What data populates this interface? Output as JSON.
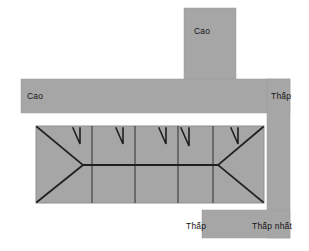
{
  "figure": {
    "type": "fishbone-band-diagram",
    "background_color": "#ffffff",
    "band_color": "#a6a6a6",
    "band_stroke_color": "#8f8f8f",
    "line_color": "#262626"
  },
  "labels": {
    "cao_top": "Cao",
    "cao_left": "Cao",
    "thap_right": "Thấp",
    "thap_bottom": "Thấp",
    "thap_nhat": "Thấp nhất"
  },
  "bands": [
    {
      "name": "top-vertical-band",
      "x": 184,
      "y": 8,
      "w": 52,
      "h": 72
    },
    {
      "name": "middle-horizontal-band",
      "x": 21,
      "y": 79,
      "w": 269,
      "h": 34
    },
    {
      "name": "right-vertical-band",
      "x": 267,
      "y": 79,
      "w": 23,
      "h": 159
    },
    {
      "name": "bottom-horizontal-band",
      "x": 202,
      "y": 210,
      "w": 88,
      "h": 28
    }
  ],
  "chart_box": {
    "name": "fishbone-panel",
    "x": 36,
    "y": 126,
    "w": 228,
    "h": 77,
    "dividers_x": [
      92,
      135,
      178,
      213
    ],
    "spine_y": 165,
    "spine_x1": 83,
    "spine_x2": 218,
    "head_left_x": 37,
    "head_right_x": 263
  },
  "tick_marks": {
    "name": "branch-ticks",
    "positions_x": [
      79,
      122,
      165,
      188,
      238
    ],
    "top_y": 128,
    "length": 16
  }
}
